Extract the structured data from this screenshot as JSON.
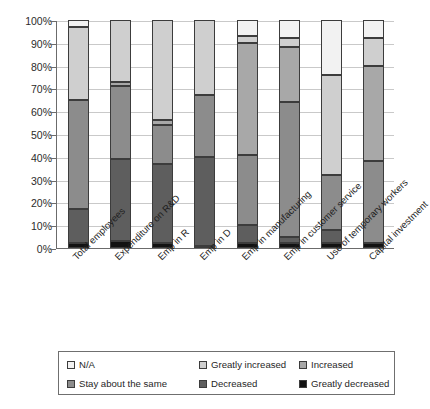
{
  "chart_data": {
    "type": "bar",
    "subtype": "stacked-100-percent-vertical",
    "title": "",
    "xlabel": "",
    "ylabel": "",
    "ylim": [
      0,
      100
    ],
    "ytick_labels": [
      "100%",
      "90%",
      "80%",
      "70%",
      "60%",
      "50%",
      "40%",
      "30%",
      "20%",
      "10%",
      "0%"
    ],
    "ytick_values": [
      100,
      90,
      80,
      70,
      60,
      50,
      40,
      30,
      20,
      10,
      0
    ],
    "grid": true,
    "grid_axis": "y",
    "legend_position": "bottom",
    "stack_order_bottom_to_top": [
      "Greatly decreased",
      "Decreased",
      "Stay about the same",
      "Increased",
      "Greatly increased",
      "N/A"
    ],
    "categories": [
      "Total employees",
      "Expenditure on R&D",
      "Emp in R",
      "Emp in D",
      "Emp in manufacturing",
      "Emp in customer service",
      "Use of temporary workers",
      "Capital investment"
    ],
    "series": [
      {
        "name": "Greatly decreased",
        "color": "#121212",
        "values": [
          2,
          3,
          2,
          1,
          2,
          2,
          2,
          2
        ]
      },
      {
        "name": "Decreased",
        "color": "#5e5e5e",
        "values": [
          15,
          36,
          35,
          39,
          8,
          3,
          6,
          0
        ]
      },
      {
        "name": "Stay about the same",
        "color": "#8c8c8c",
        "values": [
          48,
          32,
          17,
          27,
          31,
          59,
          24,
          36
        ]
      },
      {
        "name": "Increased",
        "color": "#a8a8a8",
        "values": [
          0,
          2,
          2,
          0,
          49,
          24,
          0,
          42
        ]
      },
      {
        "name": "Greatly increased",
        "color": "#cfcfcf",
        "values": [
          32,
          27,
          44,
          33,
          3,
          4,
          44,
          12
        ]
      },
      {
        "name": "N/A",
        "color": "#f2f2f2",
        "values": [
          3,
          0,
          0,
          0,
          7,
          8,
          24,
          8
        ]
      }
    ]
  },
  "legend": {
    "items": [
      {
        "label": "N/A",
        "color": "#f2f2f2"
      },
      {
        "label": "Greatly increased",
        "color": "#cfcfcf"
      },
      {
        "label": "Increased",
        "color": "#a8a8a8"
      },
      {
        "label": "Stay about the same",
        "color": "#8c8c8c"
      },
      {
        "label": "Decreased",
        "color": "#5e5e5e"
      },
      {
        "label": "Greatly decreased",
        "color": "#121212"
      }
    ]
  }
}
